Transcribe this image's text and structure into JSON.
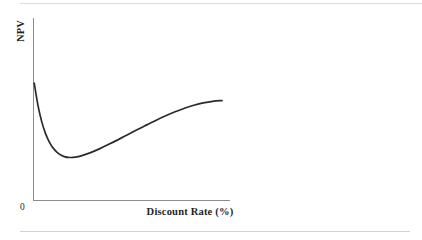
{
  "figure": {
    "background_color": "#ffffff",
    "width": 422,
    "height": 240,
    "ylabel": "NPV",
    "xlabel": "Discount Rate (%)",
    "origin_label": "0",
    "rule_color": "#d9d9d9",
    "axis_color": "#8d8d8d",
    "curve_color": "#2b2b2b"
  },
  "chart_data": {
    "type": "line",
    "title": "",
    "subtitle": "",
    "xlabel": "Discount Rate (%)",
    "ylabel": "NPV",
    "grid": false,
    "legend": "none",
    "annotations": [
      {
        "text": "0",
        "role": "origin-tick",
        "x": 0,
        "y": 0
      }
    ],
    "axis_ranges": {
      "x": [
        0,
        100
      ],
      "y": [
        0,
        100
      ]
    },
    "axis_tick_labels": {
      "x": [
        "0"
      ],
      "y": []
    },
    "series": [
      {
        "name": "NPV",
        "color": "#2b2b2b",
        "x": [
          0,
          2,
          4,
          6,
          8,
          10,
          13,
          16,
          19,
          22,
          25,
          30,
          35,
          40,
          45,
          50,
          55,
          60,
          65,
          70,
          75,
          80,
          85,
          90,
          95,
          100
        ],
        "y": [
          64.3,
          52.0,
          43.0,
          36.5,
          31.8,
          28.5,
          25.3,
          23.7,
          23.2,
          23.4,
          24.1,
          25.9,
          28.1,
          30.6,
          33.2,
          35.9,
          38.6,
          41.2,
          43.8,
          46.2,
          48.4,
          50.4,
          52.0,
          53.3,
          54.2,
          54.6
        ]
      }
    ],
    "shape_notes": {
      "curve_shape": "steep decline from the vertical axis to a shallow minimum near the left, then a gradual rise that flattens toward the right",
      "minimum_point": {
        "x": 19,
        "y": 23.2
      },
      "start_point": {
        "x": 0,
        "y": 64.3
      },
      "end_point": {
        "x": 100,
        "y": 54.6
      }
    }
  }
}
